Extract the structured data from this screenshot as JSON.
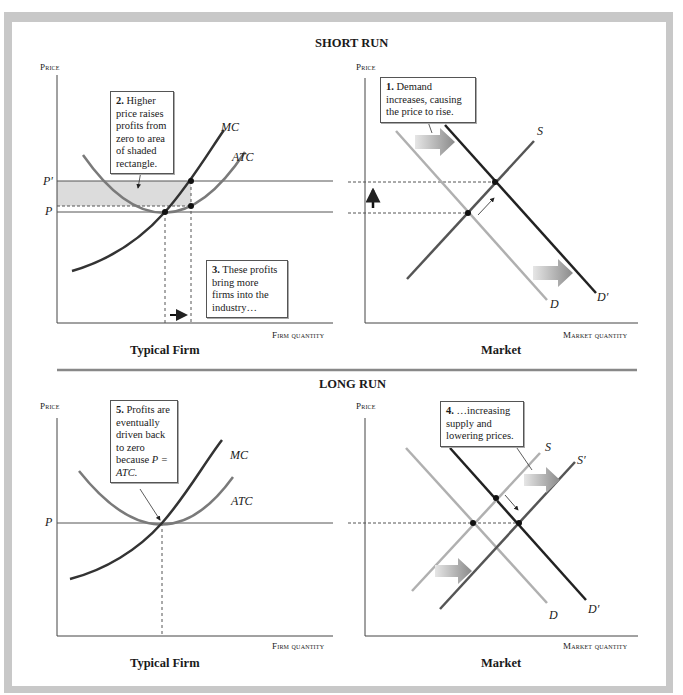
{
  "sections": {
    "short_run": "SHORT RUN",
    "long_run": "LONG RUN"
  },
  "axes": {
    "price": "Price",
    "firm_quantity": "Firm quantity",
    "market_quantity": "Market quantity"
  },
  "panels": {
    "firm": "Typical Firm",
    "market": "Market"
  },
  "labels": {
    "mc": "MC",
    "atc": "ATC",
    "p": "P",
    "p_prime": "P′",
    "s": "S",
    "s_prime": "S′",
    "d": "D",
    "d_prime": "D′"
  },
  "callouts": {
    "c1_num": "1.",
    "c1_text": "Demand increases, causing the price to rise.",
    "c2_num": "2.",
    "c2_text": "Higher price raises profits from zero to area of shaded rectangle.",
    "c3_num": "3.",
    "c3_text": "These profits bring more firms into the industry…",
    "c4_num": "4.",
    "c4_text": "…increasing supply and lowering prices.",
    "c5_num": "5.",
    "c5_text": "Profits are eventually driven back to zero because",
    "c5_eq": "P = ATC."
  },
  "colors": {
    "frame": "#c8c8c8",
    "shade": "#dcdcdc",
    "light_curve": "#b0b0b0",
    "mid_curve": "#6a6a6a",
    "dark_curve": "#222222"
  }
}
